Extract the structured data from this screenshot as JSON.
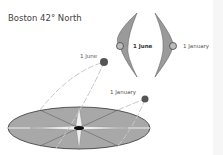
{
  "title": "Boston 42° North",
  "labels": {
    "june_sun": "1 June",
    "january_sun": "1 January",
    "june_moon": "1 June",
    "january_moon": "1 January"
  },
  "colors": {
    "disk_fill": "#a8a8a8",
    "disk_stroke": "#333333",
    "crescent_fill": "#9a9a9a",
    "sun_fill": "#555555",
    "path_stroke": "#c8c8c8"
  }
}
